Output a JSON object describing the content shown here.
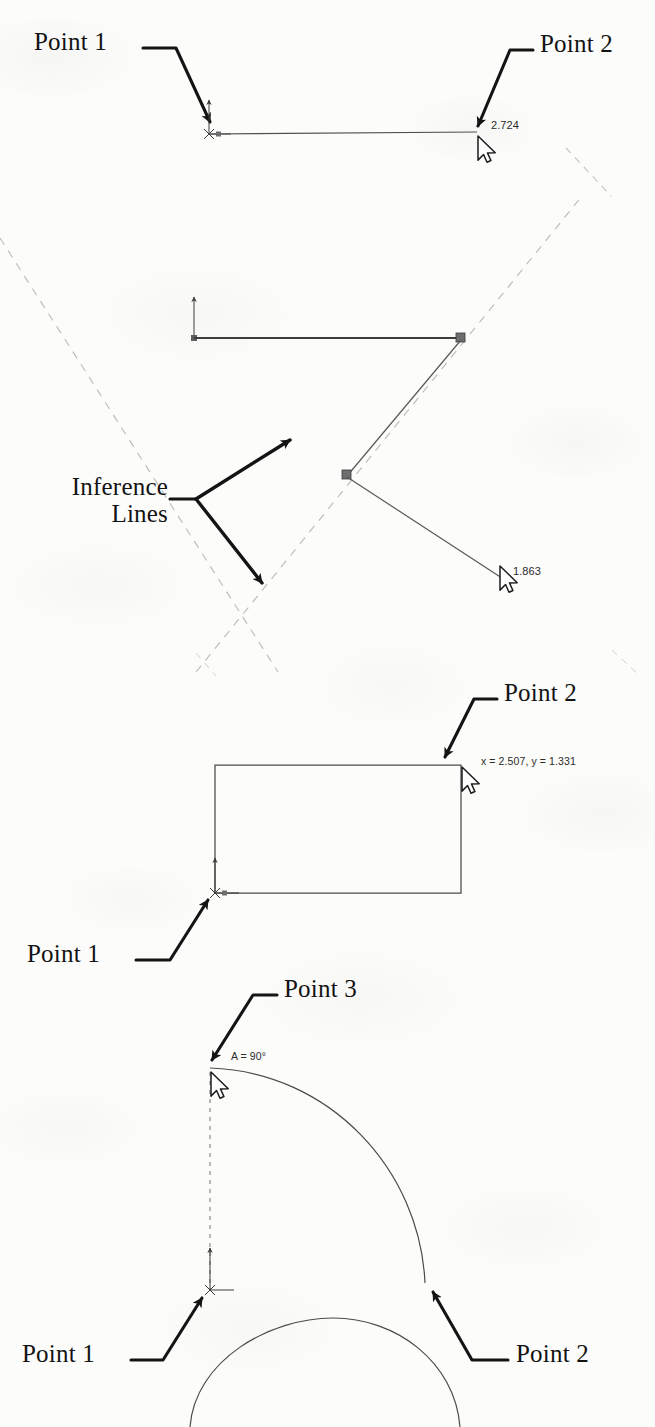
{
  "figure": {
    "background_color": "#fcfcfb",
    "ink_color": "#131313",
    "sketch_line_color": "#5a5a5a",
    "inference_line_color": "#b9b9b9",
    "handle_color": "#6e6e6e"
  },
  "panels": [
    {
      "id": "panel-line",
      "name": "horizontal-line-sketch",
      "callouts": [
        {
          "key": "p1",
          "label": "Point 1"
        },
        {
          "key": "p2",
          "label": "Point 2"
        }
      ],
      "readouts": [
        {
          "key": "length",
          "label": "2.724"
        }
      ]
    },
    {
      "id": "panel-inference",
      "name": "inference-lines-sketch",
      "callouts": [
        {
          "key": "inference",
          "label_line1": "Inference",
          "label_line2": "Lines"
        }
      ],
      "readouts": [
        {
          "key": "length",
          "label": "1.863"
        }
      ]
    },
    {
      "id": "panel-rectangle",
      "name": "rectangle-sketch",
      "callouts": [
        {
          "key": "p1",
          "label": "Point 1"
        },
        {
          "key": "p2",
          "label": "Point 2"
        }
      ],
      "readouts": [
        {
          "key": "coords",
          "label": "x = 2.507, y = 1.331"
        }
      ]
    },
    {
      "id": "panel-arc",
      "name": "arc-sketch",
      "callouts": [
        {
          "key": "p1",
          "label": "Point 1"
        },
        {
          "key": "p2",
          "label": "Point 2"
        },
        {
          "key": "p3",
          "label": "Point 3"
        }
      ],
      "readouts": [
        {
          "key": "angle",
          "label": "A = 90°"
        }
      ]
    }
  ],
  "labels": {
    "panel1_point1": "Point 1",
    "panel1_point2": "Point 2",
    "panel1_length": "2.724",
    "panel2_inference_line1": "Inference",
    "panel2_inference_line2": "Lines",
    "panel2_length": "1.863",
    "panel3_point1": "Point 1",
    "panel3_point2": "Point 2",
    "panel3_coords": "x = 2.507, y = 1.331",
    "panel4_point1": "Point 1",
    "panel4_point2": "Point 2",
    "panel4_point3": "Point 3",
    "panel4_angle": "A = 90°"
  }
}
